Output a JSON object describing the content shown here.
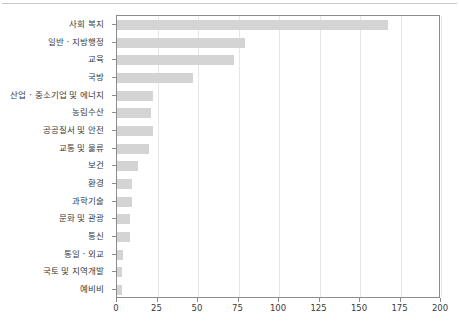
{
  "chart_data": {
    "type": "bar",
    "orientation": "horizontal",
    "title": "",
    "subtitle": "",
    "xlabel": "",
    "ylabel": "",
    "xlim": [
      0,
      200
    ],
    "ylim": null,
    "grid": "vertical",
    "legend": "none",
    "bar_color": "#d4d4d4",
    "frame_color": "#8c8c8c",
    "gridline_color": "#e6e6e6",
    "text_color": "#3a3a3a",
    "xticks": [
      0,
      25,
      50,
      75,
      100,
      125,
      150,
      175,
      200
    ],
    "xtick_labels": [
      "0",
      "25",
      "50",
      "75",
      "100",
      "125",
      "150",
      "175",
      "200"
    ],
    "categories": [
      "사회 복지",
      "일반 · 지방행정",
      "교육",
      "국방",
      "산업 · 중소기업 및 에너지",
      "농림수산",
      "공공질서 및 안전",
      "교통 및 물류",
      "보건",
      "환경",
      "과학기술",
      "문화 및 관광",
      "통신",
      "통일 · 외교",
      "국토 및 지역개발",
      "예비비"
    ],
    "values": [
      167,
      79,
      72,
      47,
      22,
      21,
      22,
      20,
      13,
      9,
      9,
      8,
      8,
      4,
      3,
      3
    ]
  }
}
